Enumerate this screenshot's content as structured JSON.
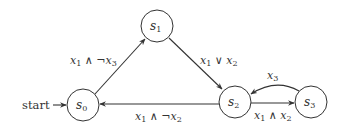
{
  "diagram": {
    "type": "finite-state-automaton",
    "start_label": "start",
    "states": [
      {
        "id": "s0",
        "name": "s",
        "sub": "0",
        "cx": 83,
        "cy": 105,
        "r": 16,
        "initial": true
      },
      {
        "id": "s1",
        "name": "s",
        "sub": "1",
        "cx": 157,
        "cy": 26,
        "r": 16
      },
      {
        "id": "s2",
        "name": "s",
        "sub": "2",
        "cx": 235,
        "cy": 100,
        "r": 16
      },
      {
        "id": "s3",
        "name": "s",
        "sub": "3",
        "cx": 311,
        "cy": 102,
        "r": 16
      }
    ],
    "transitions": [
      {
        "from": "s0",
        "to": "s1",
        "label": {
          "a": "x",
          "a_sub": "1",
          "op": " ∧ ¬",
          "b": "x",
          "b_sub": "3"
        }
      },
      {
        "from": "s1",
        "to": "s2",
        "label": {
          "a": "x",
          "a_sub": "1",
          "op": " ∨ ",
          "b": "x",
          "b_sub": "2"
        }
      },
      {
        "from": "s2",
        "to": "s0",
        "label": {
          "a": "x",
          "a_sub": "1",
          "op": " ∧ ¬",
          "b": "x",
          "b_sub": "2"
        }
      },
      {
        "from": "s3",
        "to": "s2",
        "label": {
          "a": "x",
          "a_sub": "3"
        }
      },
      {
        "from": "s2",
        "to": "s3",
        "label": {
          "a": "x",
          "a_sub": "1",
          "op": " ∧ ",
          "b": "x",
          "b_sub": "2"
        }
      }
    ],
    "colors": {
      "stroke": "#333333",
      "background": "#ffffff"
    }
  }
}
